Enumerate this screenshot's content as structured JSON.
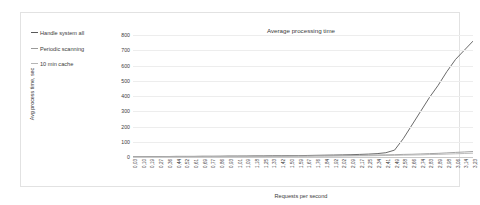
{
  "chart_data": {
    "type": "line",
    "title": "Average processing time",
    "xlabel": "Requests per second",
    "ylabel": "Avg process time, sec",
    "ylim": [
      0,
      800
    ],
    "yticks": [
      0,
      100,
      200,
      300,
      400,
      500,
      600,
      700,
      800
    ],
    "grid": true,
    "legend_position": "left-outside",
    "categories": [
      "0,03",
      "0,10",
      "0,19",
      "0,27",
      "0,36",
      "0,44",
      "0,52",
      "0,61",
      "0,69",
      "0,77",
      "0,86",
      "0,93",
      "1,01",
      "1,09",
      "1,18",
      "1,25",
      "1,33",
      "1,42",
      "1,50",
      "1,59",
      "1,67",
      "1,76",
      "1,84",
      "1,92",
      "2,02",
      "2,09",
      "2,17",
      "2,25",
      "2,34",
      "2,41",
      "2,49",
      "2,58",
      "2,66",
      "2,74",
      "2,83",
      "2,89",
      "2,98",
      "3,06",
      "3,14",
      "3,23"
    ],
    "series": [
      {
        "name": "Handle system all",
        "color": "#595959",
        "values": [
          2,
          2,
          3,
          3,
          3,
          4,
          4,
          4,
          5,
          5,
          5,
          6,
          6,
          6,
          7,
          7,
          8,
          8,
          9,
          9,
          10,
          11,
          12,
          13,
          14,
          15,
          17,
          19,
          22,
          28,
          45,
          120,
          210,
          300,
          390,
          470,
          560,
          640,
          700,
          760
        ]
      },
      {
        "name": "Periodic scanning",
        "color": "#9a9a9a",
        "values": [
          1,
          1,
          2,
          2,
          2,
          2,
          3,
          3,
          3,
          3,
          4,
          4,
          4,
          5,
          5,
          5,
          6,
          6,
          6,
          7,
          7,
          8,
          8,
          9,
          9,
          10,
          11,
          12,
          13,
          14,
          15,
          17,
          18,
          20,
          22,
          24,
          27,
          30,
          33,
          36
        ]
      },
      {
        "name": "10 min cache",
        "color": "#b5b5b5",
        "values": [
          1,
          1,
          1,
          1,
          2,
          2,
          2,
          2,
          2,
          3,
          3,
          3,
          3,
          3,
          4,
          4,
          4,
          4,
          5,
          5,
          5,
          6,
          6,
          6,
          7,
          7,
          8,
          8,
          9,
          10,
          11,
          12,
          13,
          14,
          16,
          17,
          19,
          21,
          23,
          25
        ]
      }
    ]
  }
}
